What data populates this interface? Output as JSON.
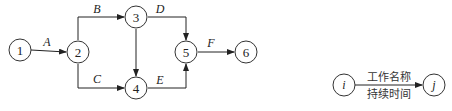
{
  "diagram": {
    "type": "activity-on-arrow network",
    "nodes": [
      {
        "id": "1",
        "label": "1",
        "x": 20,
        "y": 50
      },
      {
        "id": "2",
        "label": "2",
        "x": 78,
        "y": 52
      },
      {
        "id": "3",
        "label": "3",
        "x": 136,
        "y": 17
      },
      {
        "id": "4",
        "label": "4",
        "x": 136,
        "y": 88
      },
      {
        "id": "5",
        "label": "5",
        "x": 186,
        "y": 52
      },
      {
        "id": "6",
        "label": "6",
        "x": 246,
        "y": 52
      }
    ],
    "edges": [
      {
        "from": "1",
        "to": "2",
        "label": "A"
      },
      {
        "from": "2",
        "to": "3",
        "label": "B"
      },
      {
        "from": "2",
        "to": "4",
        "label": "C"
      },
      {
        "from": "3",
        "to": "5",
        "label": "D"
      },
      {
        "from": "3",
        "to": "4",
        "label": ""
      },
      {
        "from": "4",
        "to": "5",
        "label": "E"
      },
      {
        "from": "5",
        "to": "6",
        "label": "F"
      }
    ]
  },
  "legend": {
    "start_node": "i",
    "end_node": "j",
    "top_text": "工作名称",
    "bottom_text": "持续时间"
  }
}
